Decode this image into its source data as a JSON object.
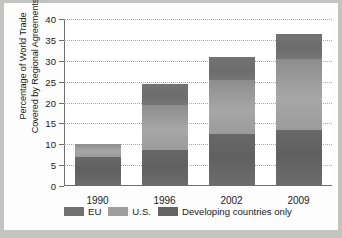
{
  "chart_data": {
    "type": "bar",
    "subtype": "stacked-bar",
    "title": "",
    "xlabel": "",
    "ylabel": "Percentage of World Trade Covered by Regional Agreements",
    "ylabel_lines": [
      "Percentage of World Trade",
      "Covered by Regional Agreements"
    ],
    "categories": [
      "1990",
      "1996",
      "2002",
      "2009"
    ],
    "ylim": [
      0,
      40
    ],
    "yticks": [
      0,
      5,
      10,
      15,
      20,
      25,
      30,
      35,
      40
    ],
    "ytick_labels": [
      "0",
      "5",
      "10",
      "15",
      "20",
      "25",
      "30",
      "35",
      "40"
    ],
    "grid": true,
    "grid_style": "dotted-horizontal",
    "legend_position": "bottom",
    "stack_order_bottom_to_top": [
      "Developing countries only",
      "U.S.",
      "EU"
    ],
    "series": [
      {
        "name": "Developing countries only",
        "color": "#646464",
        "values": [
          7.0,
          8.7,
          12.4,
          13.5
        ]
      },
      {
        "name": "U.S.",
        "color": "#9e9e9e",
        "values": [
          3.0,
          10.6,
          13.1,
          17.0
        ]
      },
      {
        "name": "EU",
        "color": "#717171",
        "values": [
          0.0,
          5.2,
          5.4,
          5.9
        ]
      }
    ],
    "totals": [
      10.0,
      24.5,
      30.9,
      36.4
    ]
  },
  "legend": {
    "items": [
      {
        "label": "EU",
        "swatch_color": "#717171"
      },
      {
        "label": "U.S.",
        "swatch_color": "#9e9e9e"
      },
      {
        "label": "Developing countries only",
        "swatch_color": "#646464"
      }
    ]
  },
  "colors": {
    "page_background": "#c3c3c2",
    "card_background": "#fdfdfd",
    "plot_background": "#ffffff",
    "axis": "#6e6e6e",
    "grid": "#a9a9a9",
    "text": "#1b1b1b"
  }
}
